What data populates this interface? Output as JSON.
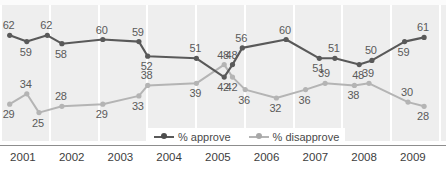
{
  "top_clipped_text": "",
  "legend": {
    "position": "bottom-center",
    "items": [
      {
        "label": "% approve",
        "color": "#595959",
        "icon": "line-marker-icon"
      },
      {
        "label": "% disapprove",
        "color": "#b4b4b4",
        "icon": "line-marker-icon"
      }
    ]
  },
  "axis": {
    "years": [
      "2001",
      "2002",
      "2003",
      "2004",
      "2005",
      "2006",
      "2007",
      "2008",
      "2009"
    ]
  },
  "colors": {
    "approve": "#595959",
    "disapprove": "#b4b4b4",
    "plot_background": "#eeeeee",
    "gridline": "#ffffff",
    "label_text": "#5a5a5a",
    "axis_text": "#3d3d3d",
    "axis_rule": "#8d8d8d"
  },
  "chart_data": {
    "type": "line",
    "title": "",
    "subtitle": "",
    "xlabel": "",
    "ylabel": "",
    "ylim": [
      20,
      66
    ],
    "xlim": [
      2000.75,
      2009.9
    ],
    "grid": "vertical-only",
    "legend_position": "bottom-center",
    "categories": [
      "2001",
      "2002",
      "2003",
      "2004",
      "2005",
      "2006",
      "2007",
      "2008",
      "2009"
    ],
    "series": [
      {
        "name": "% approve",
        "color": "#595959",
        "points": [
          {
            "x": 2000.95,
            "value": 62,
            "label_pos": "above"
          },
          {
            "x": 2001.3,
            "value": 59,
            "label_pos": "below"
          },
          {
            "x": 2001.72,
            "value": 62,
            "label_pos": "above"
          },
          {
            "x": 2002.02,
            "value": 58,
            "label_pos": "below"
          },
          {
            "x": 2002.86,
            "value": 60,
            "label_pos": "above"
          },
          {
            "x": 2003.6,
            "value": 59,
            "label_pos": "above"
          },
          {
            "x": 2003.78,
            "value": 52,
            "label_pos": "below"
          },
          {
            "x": 2004.78,
            "value": 51,
            "label_pos": "above"
          },
          {
            "x": 2005.35,
            "value": 42,
            "label_pos": "below"
          },
          {
            "x": 2005.52,
            "value": 48,
            "label_pos": "above"
          },
          {
            "x": 2005.72,
            "value": 56,
            "label_pos": "above"
          },
          {
            "x": 2006.62,
            "value": 60,
            "label_pos": "above"
          },
          {
            "x": 2007.3,
            "value": 51,
            "label_pos": "below"
          },
          {
            "x": 2007.62,
            "value": 51,
            "label_pos": "above"
          },
          {
            "x": 2008.12,
            "value": 48,
            "label_pos": "below"
          },
          {
            "x": 2008.38,
            "value": 50,
            "label_pos": "above"
          },
          {
            "x": 2009.05,
            "value": 59,
            "label_pos": "below"
          },
          {
            "x": 2009.45,
            "value": 61,
            "label_pos": "above"
          }
        ]
      },
      {
        "name": "% disapprove",
        "color": "#b4b4b4",
        "points": [
          {
            "x": 2000.95,
            "value": 29,
            "label_pos": "below"
          },
          {
            "x": 2001.3,
            "value": 34,
            "label_pos": "above"
          },
          {
            "x": 2001.55,
            "value": 25,
            "label_pos": "below"
          },
          {
            "x": 2002.02,
            "value": 28,
            "label_pos": "above"
          },
          {
            "x": 2002.86,
            "value": 29,
            "label_pos": "below"
          },
          {
            "x": 2003.6,
            "value": 33,
            "label_pos": "below"
          },
          {
            "x": 2003.78,
            "value": 38,
            "label_pos": "above"
          },
          {
            "x": 2004.78,
            "value": 39,
            "label_pos": "below"
          },
          {
            "x": 2005.35,
            "value": 48,
            "label_pos": "above"
          },
          {
            "x": 2005.52,
            "value": 42,
            "label_pos": "below"
          },
          {
            "x": 2005.78,
            "value": 36,
            "label_pos": "below"
          },
          {
            "x": 2006.42,
            "value": 32,
            "label_pos": "below"
          },
          {
            "x": 2007.02,
            "value": 36,
            "label_pos": "below"
          },
          {
            "x": 2007.42,
            "value": 39,
            "label_pos": "above"
          },
          {
            "x": 2008.02,
            "value": 38,
            "label_pos": "below"
          },
          {
            "x": 2008.32,
            "value": 39,
            "label_pos": "above"
          },
          {
            "x": 2009.12,
            "value": 30,
            "label_pos": "above"
          },
          {
            "x": 2009.45,
            "value": 28,
            "label_pos": "below"
          }
        ]
      }
    ]
  }
}
